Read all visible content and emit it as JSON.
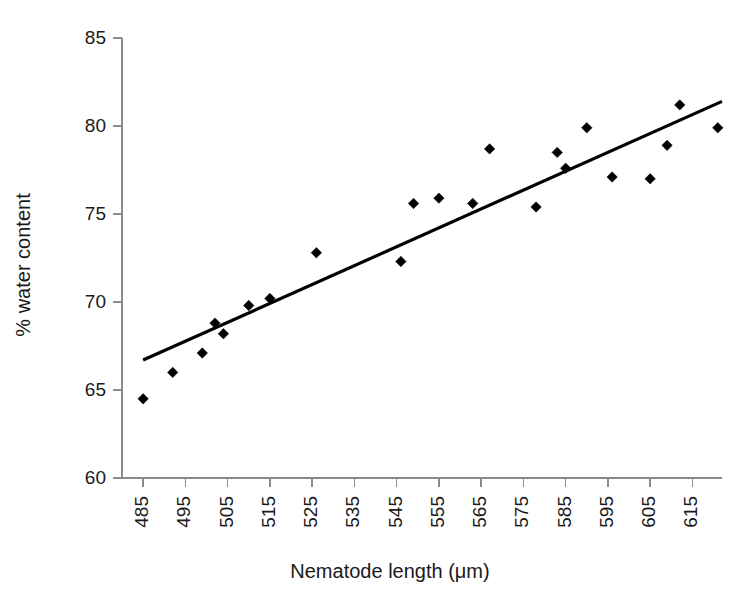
{
  "chart_data": {
    "type": "scatter",
    "title": "",
    "xlabel": "Nematode length (μm)",
    "ylabel": "% water content",
    "xlim": [
      480,
      622
    ],
    "ylim": [
      60,
      85
    ],
    "xticks": [
      485,
      495,
      505,
      515,
      525,
      535,
      545,
      555,
      565,
      575,
      585,
      595,
      605,
      615
    ],
    "yticks": [
      60,
      65,
      70,
      75,
      80,
      85
    ],
    "xtick_labels": [
      "485",
      "495",
      "505",
      "515",
      "525",
      "535",
      "545",
      "555",
      "565",
      "575",
      "585",
      "595",
      "605",
      "615"
    ],
    "ytick_labels": [
      "60",
      "65",
      "70",
      "75",
      "80",
      "85"
    ],
    "grid": false,
    "legend": false,
    "marker": "diamond",
    "marker_color": "#000000",
    "points": [
      {
        "x": 485,
        "y": 64.5
      },
      {
        "x": 492,
        "y": 66.0
      },
      {
        "x": 499,
        "y": 67.1
      },
      {
        "x": 502,
        "y": 68.8
      },
      {
        "x": 504,
        "y": 68.2
      },
      {
        "x": 510,
        "y": 69.8
      },
      {
        "x": 515,
        "y": 70.2
      },
      {
        "x": 526,
        "y": 72.8
      },
      {
        "x": 546,
        "y": 72.3
      },
      {
        "x": 549,
        "y": 75.6
      },
      {
        "x": 555,
        "y": 75.9
      },
      {
        "x": 563,
        "y": 75.6
      },
      {
        "x": 567,
        "y": 78.7
      },
      {
        "x": 578,
        "y": 75.4
      },
      {
        "x": 583,
        "y": 78.5
      },
      {
        "x": 585,
        "y": 77.6
      },
      {
        "x": 590,
        "y": 79.9
      },
      {
        "x": 596,
        "y": 77.1
      },
      {
        "x": 605,
        "y": 77.0
      },
      {
        "x": 609,
        "y": 78.9
      },
      {
        "x": 612,
        "y": 81.2
      },
      {
        "x": 621,
        "y": 79.9
      }
    ],
    "trendline": {
      "type": "linear",
      "x_start": 485,
      "y_start": 66.7,
      "x_end": 622,
      "y_end": 81.4,
      "color": "#000000"
    }
  }
}
